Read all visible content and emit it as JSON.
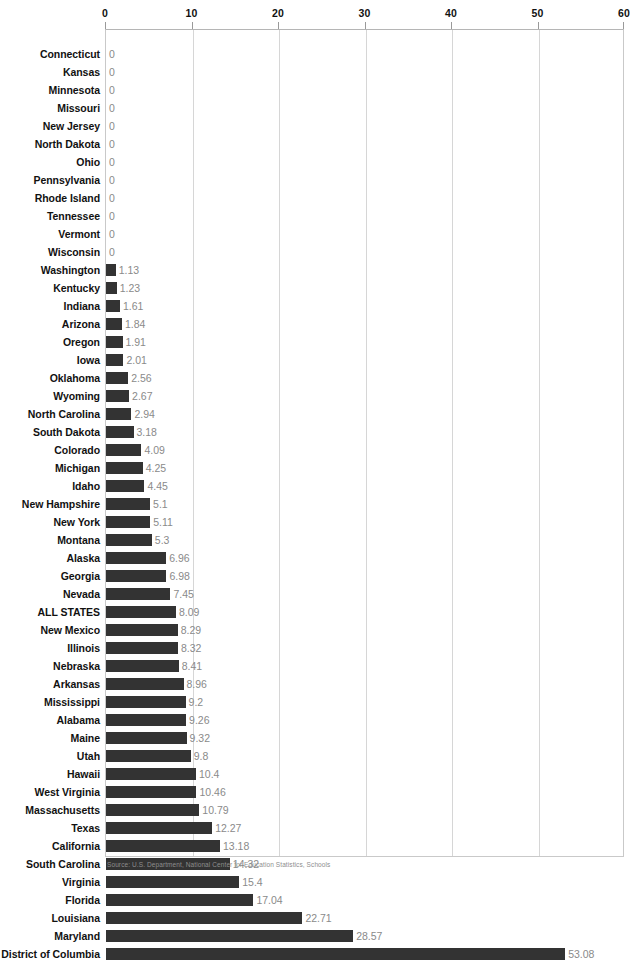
{
  "chart_data": {
    "type": "bar",
    "orientation": "horizontal",
    "title": "",
    "xlabel": "",
    "ylabel": "",
    "xlim": [
      0,
      60
    ],
    "xticks": [
      0,
      10,
      20,
      30,
      40,
      50,
      60
    ],
    "grid": true,
    "legend": null,
    "bar_color": "#333333",
    "value_label_color": "#8a8a8a",
    "categories": [
      "Connecticut",
      "Kansas",
      "Minnesota",
      "Missouri",
      "New Jersey",
      "North Dakota",
      "Ohio",
      "Pennsylvania",
      "Rhode Island",
      "Tennessee",
      "Vermont",
      "Wisconsin",
      "Washington",
      "Kentucky",
      "Indiana",
      "Arizona",
      "Oregon",
      "Iowa",
      "Oklahoma",
      "Wyoming",
      "North Carolina",
      "South Dakota",
      "Colorado",
      "Michigan",
      "Idaho",
      "New Hampshire",
      "New York",
      "Montana",
      "Alaska",
      "Georgia",
      "Nevada",
      "ALL STATES",
      "New Mexico",
      "Illinois",
      "Nebraska",
      "Arkansas",
      "Mississippi",
      "Alabama",
      "Maine",
      "Utah",
      "Hawaii",
      "West Virginia",
      "Massachusetts",
      "Texas",
      "California",
      "South Carolina",
      "Virginia",
      "Florida",
      "Louisiana",
      "Maryland",
      "District of Columbia"
    ],
    "values": [
      0,
      0,
      0,
      0,
      0,
      0,
      0,
      0,
      0,
      0,
      0,
      0,
      1.13,
      1.23,
      1.61,
      1.84,
      1.91,
      2.01,
      2.56,
      2.67,
      2.94,
      3.18,
      4.09,
      4.25,
      4.45,
      5.1,
      5.11,
      5.3,
      6.96,
      6.98,
      7.45,
      8.09,
      8.29,
      8.32,
      8.41,
      8.96,
      9.2,
      9.26,
      9.32,
      9.8,
      10.4,
      10.46,
      10.79,
      12.27,
      13.18,
      14.32,
      15.4,
      17.04,
      22.71,
      28.57,
      53.08
    ],
    "value_labels": [
      "0",
      "0",
      "0",
      "0",
      "0",
      "0",
      "0",
      "0",
      "0",
      "0",
      "0",
      "0",
      "1.13",
      "1.23",
      "1.61",
      "1.84",
      "1.91",
      "2.01",
      "2.56",
      "2.67",
      "2.94",
      "3.18",
      "4.09",
      "4.25",
      "4.45",
      "5.1",
      "5.11",
      "5.3",
      "6.96",
      "6.98",
      "7.45",
      "8.09",
      "8.29",
      "8.32",
      "8.41",
      "8.96",
      "9.2",
      "9.26",
      "9.32",
      "9.8",
      "10.4",
      "10.46",
      "10.79",
      "12.27",
      "13.18",
      "14.32",
      "15.4",
      "17.04",
      "22.71",
      "28.57",
      "53.08"
    ],
    "highlight_category": "ALL STATES"
  },
  "axis": {
    "tick_labels": [
      "0",
      "10",
      "20",
      "30",
      "40",
      "50",
      "60"
    ]
  },
  "footer": {
    "source": "Source: U.S. Department, National Center for Education Statistics, Schools"
  }
}
